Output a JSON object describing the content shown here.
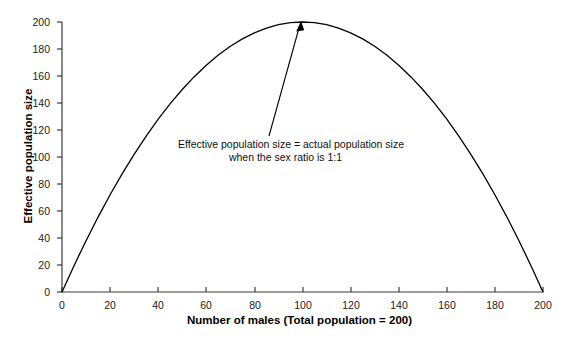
{
  "chart_data": {
    "type": "line",
    "title": "",
    "subtitle": "",
    "xlabel": "Number of males (Total population = 200)",
    "ylabel": "Effective population size",
    "xlim": [
      0,
      200
    ],
    "ylim": [
      0,
      200
    ],
    "grid": false,
    "legend": "none",
    "x_ticks": [
      "0",
      "20",
      "40",
      "60",
      "80",
      "100",
      "120",
      "140",
      "160",
      "180",
      "200"
    ],
    "y_ticks": [
      "0",
      "20",
      "40",
      "60",
      "80",
      "100",
      "120",
      "140",
      "160",
      "180",
      "200"
    ],
    "series": [
      {
        "name": "Effective population size",
        "color": "#000000",
        "formula": "Ne = 4*m*(200-m)/200",
        "x": [
          0,
          5,
          10,
          15,
          20,
          25,
          30,
          35,
          40,
          45,
          50,
          55,
          60,
          65,
          70,
          75,
          80,
          85,
          90,
          95,
          100,
          105,
          110,
          115,
          120,
          125,
          130,
          135,
          140,
          145,
          150,
          155,
          160,
          165,
          170,
          175,
          180,
          185,
          190,
          195,
          200
        ],
        "y": [
          0,
          19.5,
          38,
          55.5,
          72,
          87.5,
          102,
          115.5,
          128,
          139.5,
          150,
          159.5,
          168,
          175.5,
          182,
          187.5,
          192,
          195.5,
          198,
          199.5,
          200,
          199.5,
          198,
          195.5,
          192,
          187.5,
          182,
          175.5,
          168,
          159.5,
          150,
          139.5,
          128,
          115.5,
          102,
          87.5,
          72,
          55.5,
          38,
          19.5,
          0
        ]
      }
    ],
    "annotations": [
      {
        "name": "peak-annotation",
        "lines": [
          "Effective population size = actual population size",
          "when the sex ratio is 1:1"
        ],
        "arrow_from_x": 92,
        "arrow_from_y": 118,
        "arrow_to_x": 100,
        "arrow_to_y": 200
      }
    ]
  },
  "axes": {
    "y_title": "Effective population size",
    "x_title": "Number of males (Total population = 200)",
    "y_tick_labels": [
      "200",
      "180",
      "160",
      "140",
      "120",
      "100",
      "80",
      "60",
      "40",
      "20",
      "0"
    ],
    "x_tick_labels": [
      "0",
      "20",
      "40",
      "60",
      "80",
      "100",
      "120",
      "140",
      "160",
      "180",
      "200"
    ]
  },
  "annotation": {
    "line1": "Effective population size = actual population size",
    "line2": "when the sex ratio is 1:1"
  },
  "colors": {
    "background": "#ffffff",
    "axis": "#3a3a3a",
    "curve": "#000000",
    "text": "#000000"
  }
}
